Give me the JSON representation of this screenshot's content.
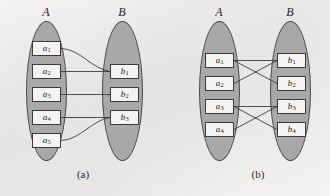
{
  "figure": {
    "type": "set-mapping-diagram",
    "background_color": "#f2f1ef",
    "ellipse_fill": "#a8a8a8",
    "ellipse_stroke": "#4a4a4a",
    "node_fill": "#f4f3f1",
    "node_stroke": "#3a3a3a",
    "edge_color": "#3c3c3c"
  },
  "panels": [
    {
      "id": "a",
      "caption": "(a)",
      "sets": [
        {
          "name": "A",
          "label": "A",
          "side": "left",
          "elements": [
            {
              "id": "a1",
              "base": "a",
              "sub": "1"
            },
            {
              "id": "a2",
              "base": "a",
              "sub": "2"
            },
            {
              "id": "a3",
              "base": "a",
              "sub": "3"
            },
            {
              "id": "a4",
              "base": "a",
              "sub": "4"
            },
            {
              "id": "a5",
              "base": "a",
              "sub": "5"
            }
          ]
        },
        {
          "name": "B",
          "label": "B",
          "side": "right",
          "elements": [
            {
              "id": "b1",
              "base": "b",
              "sub": "1"
            },
            {
              "id": "b2",
              "base": "b",
              "sub": "2"
            },
            {
              "id": "b3",
              "base": "b",
              "sub": "3"
            }
          ]
        }
      ],
      "edges": [
        {
          "from": "a1",
          "to": "b1",
          "style": "curved"
        },
        {
          "from": "a2",
          "to": "b1",
          "style": "straight"
        },
        {
          "from": "a3",
          "to": "b2",
          "style": "straight"
        },
        {
          "from": "a4",
          "to": "b3",
          "style": "straight"
        },
        {
          "from": "a5",
          "to": "b3",
          "style": "curved"
        }
      ]
    },
    {
      "id": "b",
      "caption": "(b)",
      "sets": [
        {
          "name": "A",
          "label": "A",
          "side": "left",
          "elements": [
            {
              "id": "a1",
              "base": "a",
              "sub": "1"
            },
            {
              "id": "a2",
              "base": "a",
              "sub": "2"
            },
            {
              "id": "a3",
              "base": "a",
              "sub": "3"
            },
            {
              "id": "a4",
              "base": "a",
              "sub": "4"
            }
          ]
        },
        {
          "name": "B",
          "label": "B",
          "side": "right",
          "elements": [
            {
              "id": "b1",
              "base": "b",
              "sub": "1"
            },
            {
              "id": "b2",
              "base": "b",
              "sub": "2"
            },
            {
              "id": "b3",
              "base": "b",
              "sub": "3"
            },
            {
              "id": "b4",
              "base": "b",
              "sub": "4"
            }
          ]
        }
      ],
      "edges": [
        {
          "from": "a1",
          "to": "b1",
          "style": "straight"
        },
        {
          "from": "a1",
          "to": "b2",
          "style": "straight"
        },
        {
          "from": "a2",
          "to": "b1",
          "style": "straight"
        },
        {
          "from": "a3",
          "to": "b3",
          "style": "straight"
        },
        {
          "from": "a3",
          "to": "b4",
          "style": "straight"
        },
        {
          "from": "a4",
          "to": "b3",
          "style": "straight"
        }
      ]
    }
  ]
}
